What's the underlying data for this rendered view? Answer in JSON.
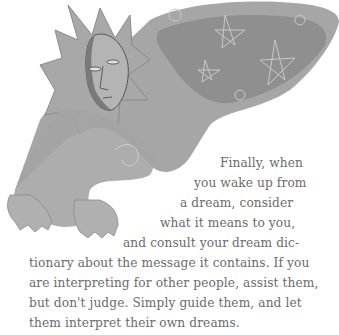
{
  "illustration": {
    "description": "grayscale drawing of a sun-faced figure with a starry cloak reaching forward",
    "fill_color": "#9a9a9a",
    "shade_color": "#7e7e7e",
    "highlight_color": "#c8c8c8"
  },
  "paragraph": {
    "text_color": "#6b6b6b",
    "lines": [
      "Finally, when",
      "you wake up from",
      "a dream, consider",
      "what it means to you,",
      "and consult your dream dic-",
      "tionary about the message it contains. If you",
      "are interpreting for other people, assist them,",
      "but don't judge. Simply guide them, and let",
      "them interpret their own dreams."
    ]
  }
}
